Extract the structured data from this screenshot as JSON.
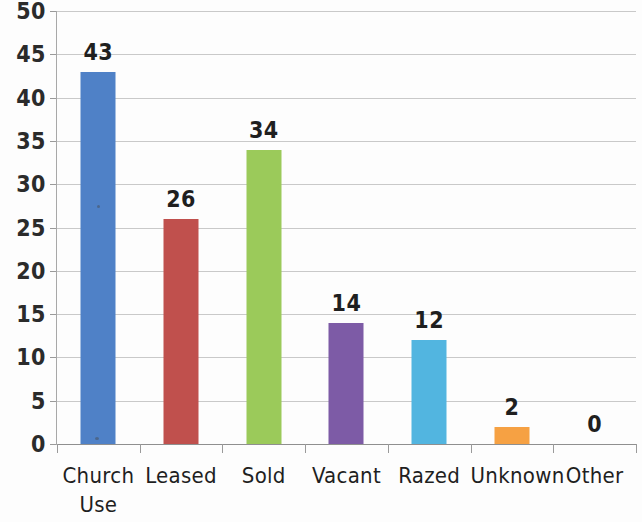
{
  "chart_data": {
    "type": "bar",
    "title": "",
    "subtitle": "",
    "xlabel": "",
    "ylabel": "",
    "categories": [
      "Church\nUse",
      "Leased",
      "Sold",
      "Vacant",
      "Razed",
      "Unknown",
      "Other"
    ],
    "values": [
      43,
      26,
      34,
      14,
      12,
      2,
      0
    ],
    "data_labels": [
      "43",
      "26",
      "34",
      "14",
      "12",
      "2",
      "0"
    ],
    "colors": [
      "#4F81C7",
      "#C0504D",
      "#9BCA5A",
      "#7D5BA6",
      "#52B5E0",
      "#F6A143",
      "#4F81C7"
    ],
    "ylim": [
      0,
      50
    ],
    "ytick_step": 5,
    "yticks": [
      0,
      5,
      10,
      15,
      20,
      25,
      30,
      35,
      40,
      45,
      50
    ],
    "ytick_labels": [
      "0",
      "5",
      "10",
      "15",
      "20",
      "25",
      "30",
      "35",
      "40",
      "45",
      "50"
    ],
    "grid": true,
    "grid_axis": "y",
    "legend": false,
    "legend_position": "none",
    "series": [
      {
        "name": "Count",
        "values": [
          43,
          26,
          34,
          14,
          12,
          2,
          0
        ]
      }
    ],
    "annotations": []
  },
  "axes": {
    "y_axis_name": "value-axis",
    "x_axis_name": "category-axis"
  }
}
